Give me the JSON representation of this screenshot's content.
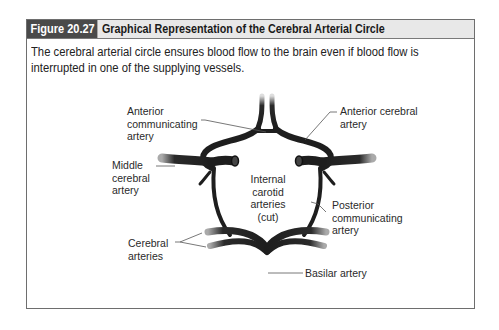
{
  "figure": {
    "number": "Figure 20.27",
    "title": "Graphical Representation of the Cerebral Arterial Circle",
    "caption": "The cerebral arterial circle ensures blood flow to the brain even if blood flow is interrupted in one of the supplying vessels."
  },
  "diagram": {
    "labels": {
      "anterior_communicating": [
        "Anterior",
        "communicating",
        "artery"
      ],
      "anterior_cerebral": [
        "Anterior cerebral",
        "artery"
      ],
      "middle_cerebral": [
        "Middle",
        "cerebral",
        "artery"
      ],
      "internal_carotid": [
        "Internal",
        "carotid",
        "arteries",
        "(cut)"
      ],
      "posterior_communicating": [
        "Posterior",
        "communicating",
        "artery"
      ],
      "cerebral_arteries": [
        "Cerebral",
        "arteries"
      ],
      "basilar": [
        "Basilar artery"
      ]
    }
  },
  "colors": {
    "header_dark": "#4a4a4a",
    "header_light": "#e8e8e8",
    "border": "#6e6e6e",
    "artery": "#1e1e1e"
  }
}
